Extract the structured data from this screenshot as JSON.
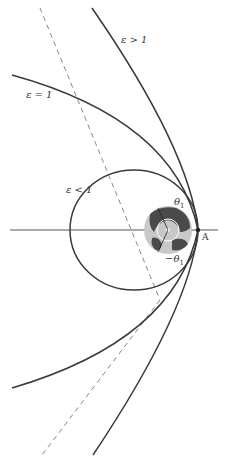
{
  "labels": {
    "hyperbola": "ε > 1",
    "parabola": "ε = 1",
    "ellipse": "ε < 1",
    "theta_pos": "θ",
    "theta_pos_sub": "1",
    "theta_neg": "−θ",
    "theta_neg_sub": "1",
    "point_A": "A"
  },
  "colors": {
    "curve": "#3a3a3a",
    "axis": "#555555",
    "dashed": "#777777",
    "earth_land": "#4a4a4a",
    "earth_ocean": "#c8c8c8",
    "background": "#ffffff"
  }
}
